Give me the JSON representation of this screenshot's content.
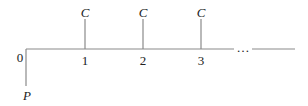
{
  "diagram": {
    "type": "cash-flow timeline",
    "initial": {
      "period": "0",
      "label": "P",
      "direction": "down"
    },
    "payments": [
      {
        "period": "1",
        "label": "C",
        "direction": "up"
      },
      {
        "period": "2",
        "label": "C",
        "direction": "up"
      },
      {
        "period": "3",
        "label": "C",
        "direction": "up"
      }
    ],
    "continuation": "…"
  }
}
